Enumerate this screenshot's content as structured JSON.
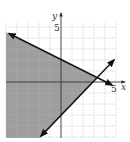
{
  "graph": {
    "axes": {
      "x_label": "x",
      "y_label": "y",
      "x_tick_label": "5",
      "y_tick_label": "5"
    },
    "grid": {
      "xmin": -5,
      "xmax": 5,
      "ymin": -5,
      "ymax": 5,
      "step": 1
    },
    "lines": [
      {
        "name": "boundary-upper",
        "equation": "y = -1/2 x + 2",
        "slope": -0.5,
        "intercept": 2,
        "style": "solid"
      },
      {
        "name": "boundary-lower",
        "equation": "y = x - 3",
        "slope": 1,
        "intercept": -3,
        "style": "solid"
      }
    ],
    "shaded_region": "y <= -1/2 x + 2 and y >= x - 3",
    "intersection": [
      3.33,
      0.33
    ],
    "colors": {
      "shade": "#9e9e9e",
      "grid": "#b0b0b0",
      "line": "#111111",
      "axis": "#333333"
    }
  }
}
